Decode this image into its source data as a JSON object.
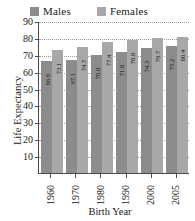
{
  "chart_data": {
    "type": "bar",
    "title": "",
    "xlabel": "Birth Year",
    "ylabel": "Life Expectancy",
    "categories": [
      "1960",
      "1970",
      "1980",
      "1990",
      "2000",
      "2005"
    ],
    "series": [
      {
        "name": "Males",
        "color": "#8c8c8c",
        "values": [
          66.6,
          67.1,
          70.0,
          71.8,
          74.3,
          75.2
        ]
      },
      {
        "name": "Females",
        "color": "#a8a8a8",
        "values": [
          73.1,
          74.7,
          77.4,
          78.8,
          79.7,
          80.4
        ]
      }
    ],
    "ylim": [
      0,
      90
    ],
    "yticks": [
      90,
      80,
      70,
      60,
      50,
      40,
      30,
      20,
      10
    ],
    "grid": true,
    "grid_style": "dotted-horizontal",
    "legend_position": "top",
    "value_labels": "rotated-vertical-inside-bar-top"
  },
  "legend": {
    "entries": [
      {
        "label": "Males",
        "color": "#8c8c8c"
      },
      {
        "label": "Females",
        "color": "#a8a8a8"
      }
    ]
  },
  "axes": {
    "y_title": "Life Expectancy",
    "x_title": "Birth Year"
  },
  "title_remnant": "",
  "colors": {
    "males": "#8c8c8c",
    "females": "#a8a8a8",
    "axis": "#4a4a4a",
    "grid": "#9a9a9a",
    "text": "#1a1a1a",
    "background": "#ffffff"
  }
}
